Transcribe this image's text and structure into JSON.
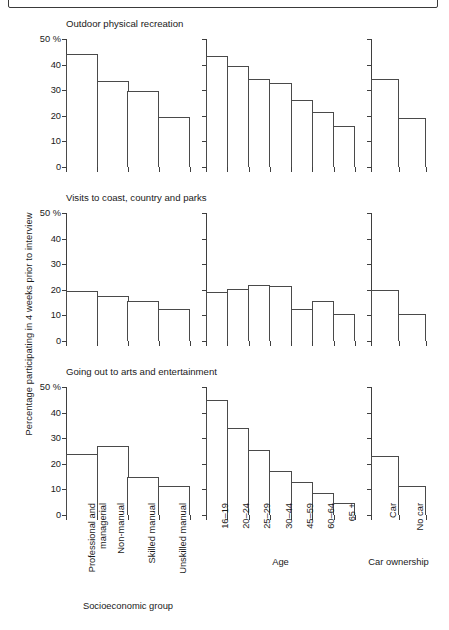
{
  "figure": {
    "y_axis_label": "Percentage participating in 4 weeks prior to interview",
    "group_captions": {
      "socioeconomic": "Socioeconomic group",
      "age": "Age",
      "car": "Car ownership"
    }
  },
  "chart_data": {
    "type": "bar",
    "title": "",
    "xlabel": "",
    "ylabel": "Percentage participating in 4 weeks prior to interview",
    "ylim": [
      0,
      50
    ],
    "yticks": [
      0,
      10,
      20,
      30,
      40,
      50
    ],
    "ytick_labels": [
      "0",
      "10",
      "20",
      "30",
      "40",
      "50 %"
    ],
    "grid": false,
    "legend": "none",
    "panels": [
      {
        "title": "Outdoor physical recreation",
        "groups": [
          {
            "name": "Socioeconomic group",
            "categories": [
              "Professional and managerial",
              "Non-manual",
              "Skilled manual",
              "Unskilled manual"
            ],
            "values": [
              44,
              33.5,
              29.5,
              19.5
            ]
          },
          {
            "name": "Age",
            "categories": [
              "16–19",
              "20–24",
              "25–29",
              "30–44",
              "45–59",
              "60–64",
              "65 +"
            ],
            "values": [
              43.5,
              39.5,
              34.5,
              33,
              26,
              21.5,
              16
            ]
          },
          {
            "name": "Car ownership",
            "categories": [
              "Car",
              "No car"
            ],
            "values": [
              34.5,
              19
            ]
          }
        ]
      },
      {
        "title": "Visits to coast, country and parks",
        "groups": [
          {
            "name": "Socioeconomic group",
            "categories": [
              "Professional and managerial",
              "Non-manual",
              "Skilled manual",
              "Unskilled manual"
            ],
            "values": [
              19.5,
              17.5,
              15.5,
              12.5
            ]
          },
          {
            "name": "Age",
            "categories": [
              "16–19",
              "20–24",
              "25–29",
              "30–44",
              "45–59",
              "60–64",
              "65 +"
            ],
            "values": [
              19,
              20.5,
              22,
              21.5,
              12.5,
              15.5,
              10.5
            ]
          },
          {
            "name": "Car ownership",
            "categories": [
              "Car",
              "No car"
            ],
            "values": [
              20,
              10.5
            ]
          }
        ]
      },
      {
        "title": "Going out to arts and entertainment",
        "groups": [
          {
            "name": "Socioeconomic group",
            "categories": [
              "Professional and managerial",
              "Non-manual",
              "Skilled manual",
              "Unskilled manual"
            ],
            "values": [
              24,
              27,
              15,
              11.5
            ]
          },
          {
            "name": "Age",
            "categories": [
              "16–19",
              "20–24",
              "25–29",
              "30–44",
              "45–59",
              "60–64",
              "65 +"
            ],
            "values": [
              45,
              34,
              25.5,
              17,
              13,
              8.5,
              4.5
            ]
          },
          {
            "name": "Car ownership",
            "categories": [
              "Car",
              "No car"
            ],
            "values": [
              23,
              11.5
            ]
          }
        ]
      }
    ],
    "category_labels": {
      "socioeconomic": [
        [
          "Professional and",
          "managerial"
        ],
        [
          "Non-manual"
        ],
        [
          "Skilled manual"
        ],
        [
          "Unskilled manual"
        ]
      ],
      "age": [
        "16–19",
        "20–24",
        "25–29",
        "30–44",
        "45–59",
        "60–64",
        "65 +"
      ],
      "car": [
        "Car",
        "No car"
      ]
    }
  }
}
